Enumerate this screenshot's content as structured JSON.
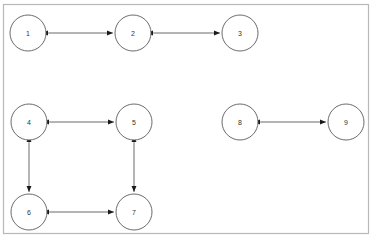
{
  "diagram": {
    "background_color": "#ffffff",
    "frame": {
      "name": "diagram-frame",
      "x": 3,
      "y": 4,
      "width": 365,
      "height": 229,
      "stroke_color": "#b8b8b8",
      "fill_color": "#ffffff"
    },
    "style": {
      "node_radius": 18,
      "node_fill": "#ffffff",
      "node_stroke": "#5a5a5a",
      "edge_stroke": "#6b6b6b",
      "label_color": "#333333",
      "arrowhead_color": "#1a1a1a"
    },
    "nodes": [
      {
        "id": "1",
        "label": "1",
        "cx": 28,
        "cy": 33
      },
      {
        "id": "2",
        "label": "2",
        "cx": 133,
        "cy": 33
      },
      {
        "id": "3",
        "label": "3",
        "cx": 240,
        "cy": 33
      },
      {
        "id": "4",
        "label": "4",
        "cx": 29,
        "cy": 122
      },
      {
        "id": "5",
        "label": "5",
        "cx": 134,
        "cy": 122
      },
      {
        "id": "6",
        "label": "6",
        "cx": 29,
        "cy": 212
      },
      {
        "id": "7",
        "label": "7",
        "cx": 134,
        "cy": 212
      },
      {
        "id": "8",
        "label": "8",
        "cx": 240,
        "cy": 122
      },
      {
        "id": "9",
        "label": "9",
        "cx": 346,
        "cy": 122
      }
    ],
    "edges": [
      {
        "id": "edge-1-2",
        "source": "1",
        "target": "2",
        "direction": "both"
      },
      {
        "id": "edge-2-3",
        "source": "2",
        "target": "3",
        "direction": "both"
      },
      {
        "id": "edge-4-5",
        "source": "4",
        "target": "5",
        "direction": "both"
      },
      {
        "id": "edge-4-6",
        "source": "4",
        "target": "6",
        "direction": "both"
      },
      {
        "id": "edge-5-7",
        "source": "5",
        "target": "7",
        "direction": "both"
      },
      {
        "id": "edge-6-7",
        "source": "6",
        "target": "7",
        "direction": "both"
      },
      {
        "id": "edge-8-9",
        "source": "8",
        "target": "9",
        "direction": "both"
      }
    ]
  }
}
